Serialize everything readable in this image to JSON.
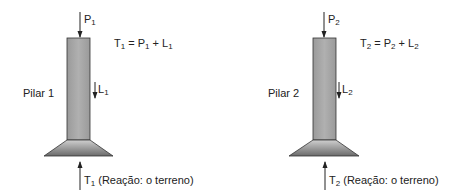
{
  "pillars": [
    {
      "name": "Pilar 1",
      "label": "Pilar 1",
      "load_top": {
        "symbol": "P",
        "sub": "1"
      },
      "self_weight": {
        "symbol": "L",
        "sub": "1"
      },
      "reaction": {
        "symbol": "T",
        "sub": "1",
        "note": "(Reação: o terreno)"
      },
      "equation": {
        "lhs": "T",
        "lhs_sub": "1",
        "eq": " = ",
        "p": "P",
        "p_sub": "1",
        "plus": " + ",
        "l": "L",
        "l_sub": "1"
      }
    },
    {
      "name": "Pilar 2",
      "label": "Pilar 2",
      "load_top": {
        "symbol": "P",
        "sub": "2"
      },
      "self_weight": {
        "symbol": "L",
        "sub": "2"
      },
      "reaction": {
        "symbol": "T",
        "sub": "2",
        "note": "(Reação: o terreno)"
      },
      "equation": {
        "lhs": "T",
        "lhs_sub": "2",
        "eq": " = ",
        "p": "P",
        "p_sub": "2",
        "plus": " + ",
        "l": "L",
        "l_sub": "2"
      }
    }
  ],
  "colors": {
    "column_fill": "#a8a8a8",
    "stroke": "#333333",
    "footing_top": "#c8c8c8",
    "footing_bottom": "#6e6e6e"
  }
}
